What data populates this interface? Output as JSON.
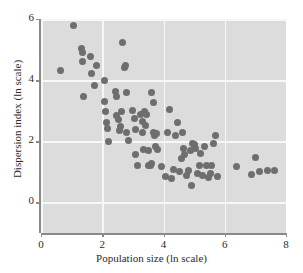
{
  "chart_data": {
    "type": "scatter",
    "title": "",
    "xlabel": "Population size (ln scale)",
    "ylabel": "Dispersion index (ln scale)",
    "xlim": [
      0,
      8
    ],
    "ylim": [
      -1,
      6
    ],
    "xticks": [
      0,
      2,
      4,
      6,
      8
    ],
    "yticks": [
      0,
      2,
      4,
      6
    ],
    "xtick_labels": [
      "0",
      "2",
      "4",
      "6",
      "8"
    ],
    "ytick_labels": [
      "0",
      "2",
      "4",
      "6"
    ],
    "grid": true,
    "grid_color": "#f7f7f7",
    "panel_color": "#dcdcdc",
    "marker_color": "#6e6e6e",
    "marker_size": 7,
    "legend": null,
    "series": [
      {
        "name": "observations",
        "points": [
          [
            0.65,
            4.33
          ],
          [
            1.05,
            5.78
          ],
          [
            1.33,
            5.05
          ],
          [
            1.34,
            4.92
          ],
          [
            1.35,
            4.6
          ],
          [
            1.38,
            3.48
          ],
          [
            1.62,
            4.78
          ],
          [
            1.66,
            4.22
          ],
          [
            1.74,
            3.82
          ],
          [
            1.8,
            4.47
          ],
          [
            2.07,
            3.3
          ],
          [
            2.08,
            4.0
          ],
          [
            2.1,
            2.96
          ],
          [
            2.14,
            2.63
          ],
          [
            2.17,
            2.42
          ],
          [
            2.2,
            1.98
          ],
          [
            2.42,
            3.62
          ],
          [
            2.45,
            3.48
          ],
          [
            2.48,
            2.85
          ],
          [
            2.52,
            2.72
          ],
          [
            2.55,
            2.35
          ],
          [
            2.58,
            2.47
          ],
          [
            2.62,
            2.96
          ],
          [
            2.66,
            5.22
          ],
          [
            2.72,
            4.4
          ],
          [
            2.76,
            4.48
          ],
          [
            2.78,
            3.58
          ],
          [
            2.8,
            2.3
          ],
          [
            2.86,
            2.02
          ],
          [
            3.0,
            3.02
          ],
          [
            3.05,
            2.76
          ],
          [
            3.08,
            2.4
          ],
          [
            3.1,
            1.58
          ],
          [
            3.14,
            1.22
          ],
          [
            3.25,
            2.88
          ],
          [
            3.3,
            2.64
          ],
          [
            3.32,
            2.28
          ],
          [
            3.35,
            1.72
          ],
          [
            3.38,
            2.96
          ],
          [
            3.42,
            2.52
          ],
          [
            3.46,
            2.86
          ],
          [
            3.5,
            1.7
          ],
          [
            3.52,
            1.22
          ],
          [
            3.56,
            1.2
          ],
          [
            3.6,
            1.27
          ],
          [
            3.62,
            3.6
          ],
          [
            3.66,
            3.28
          ],
          [
            3.68,
            2.3
          ],
          [
            3.7,
            2.2
          ],
          [
            3.74,
            1.82
          ],
          [
            3.78,
            2.24
          ],
          [
            3.82,
            1.74
          ],
          [
            3.95,
            1.18
          ],
          [
            4.05,
            0.85
          ],
          [
            4.12,
            2.3
          ],
          [
            4.2,
            3.04
          ],
          [
            4.25,
            0.78
          ],
          [
            4.32,
            1.08
          ],
          [
            4.38,
            2.2
          ],
          [
            4.45,
            2.62
          ],
          [
            4.52,
            1.0
          ],
          [
            4.58,
            1.44
          ],
          [
            4.62,
            2.28
          ],
          [
            4.66,
            1.78
          ],
          [
            4.7,
            1.58
          ],
          [
            4.74,
            0.88
          ],
          [
            4.8,
            1.04
          ],
          [
            4.88,
            1.7
          ],
          [
            4.92,
            0.55
          ],
          [
            4.96,
            1.92
          ],
          [
            5.0,
            1.88
          ],
          [
            5.05,
            1.78
          ],
          [
            5.1,
            0.94
          ],
          [
            5.18,
            1.22
          ],
          [
            5.22,
            1.6
          ],
          [
            5.28,
            0.88
          ],
          [
            5.34,
            1.82
          ],
          [
            5.4,
            1.2
          ],
          [
            5.46,
            0.82
          ],
          [
            5.52,
            0.96
          ],
          [
            5.58,
            1.22
          ],
          [
            5.64,
            1.92
          ],
          [
            5.7,
            2.2
          ],
          [
            5.76,
            0.86
          ],
          [
            6.38,
            1.18
          ],
          [
            6.88,
            0.92
          ],
          [
            7.0,
            1.48
          ],
          [
            7.12,
            1.0
          ],
          [
            7.38,
            1.06
          ],
          [
            7.62,
            1.06
          ]
        ]
      }
    ]
  }
}
